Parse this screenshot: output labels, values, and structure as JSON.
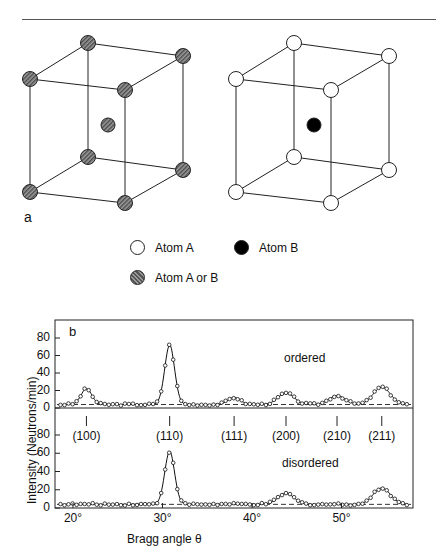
{
  "figure": {
    "panel_a_label": "a",
    "panel_b_label": "b",
    "legend": [
      {
        "label": "Atom A",
        "style": "white"
      },
      {
        "label": "Atom B",
        "style": "black"
      },
      {
        "label": "Atom A or B",
        "style": "hatched"
      }
    ],
    "cells": [
      {
        "name": "disordered-cell",
        "corner_atoms": "hatched",
        "center_atom": "hatched"
      },
      {
        "name": "ordered-cell",
        "corner_atoms": "white",
        "center_atom": "black"
      }
    ]
  },
  "chart_data": {
    "type": "line",
    "title": "",
    "xlabel": "Bragg angle θ",
    "ylabel": "Intensity (Neutrons/min)",
    "x_ticks": [
      "20°",
      "30°",
      "40°",
      "50°"
    ],
    "y_ticks": [
      "0",
      "20",
      "40",
      "60",
      "80"
    ],
    "xlim": [
      18,
      58
    ],
    "ylim": [
      0,
      100
    ],
    "reflections": [
      {
        "label": "(100)",
        "theta": 21.5
      },
      {
        "label": "(110)",
        "theta": 30.8
      },
      {
        "label": "(111)",
        "theta": 38.0
      },
      {
        "label": "(200)",
        "theta": 43.8
      },
      {
        "label": "(210)",
        "theta": 49.5
      },
      {
        "label": "(211)",
        "theta": 54.5
      }
    ],
    "series": [
      {
        "name": "ordered",
        "background": 4,
        "peaks": [
          {
            "theta": 21.5,
            "height": 18,
            "width": 0.6
          },
          {
            "theta": 30.8,
            "height": 68,
            "width": 0.55
          },
          {
            "theta": 38.0,
            "height": 8,
            "width": 0.7
          },
          {
            "theta": 43.8,
            "height": 13,
            "width": 0.9
          },
          {
            "theta": 49.5,
            "height": 10,
            "width": 0.9
          },
          {
            "theta": 54.5,
            "height": 20,
            "width": 0.95
          }
        ]
      },
      {
        "name": "disordered",
        "background": 4,
        "peaks": [
          {
            "theta": 30.8,
            "height": 58,
            "width": 0.55
          },
          {
            "theta": 43.8,
            "height": 12,
            "width": 0.9
          },
          {
            "theta": 54.5,
            "height": 18,
            "width": 0.95
          }
        ]
      }
    ]
  }
}
